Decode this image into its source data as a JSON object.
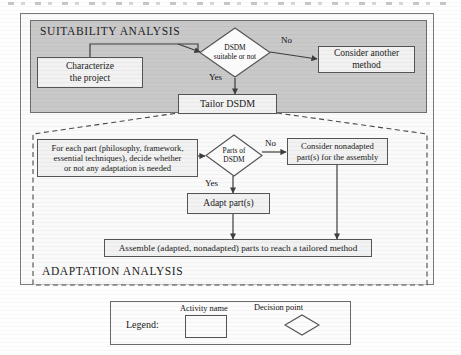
{
  "figure": {
    "regions": {
      "suitability": {
        "title": "SUITABILITY ANALYSIS"
      },
      "adaptation": {
        "title": "ADAPTATION ANALYSIS"
      }
    },
    "nodes": {
      "characterize": {
        "label": "Characterize\nthe project",
        "type": "activity"
      },
      "dsdm_decision": {
        "label": "DSDM\nsuitable or not",
        "type": "decision"
      },
      "consider_another": {
        "label": "Consider another\nmethod",
        "type": "activity"
      },
      "tailor_dsdm": {
        "label": "Tailor DSDM",
        "type": "activity"
      },
      "for_each_part": {
        "label": "For each part (philosophy, framework,\nessential techniques), decide whether\nor not any adaptation is needed",
        "type": "activity"
      },
      "parts_decision": {
        "label": "Parts of\nDSDM",
        "type": "decision"
      },
      "consider_nonadapted": {
        "label": "Consider nonadapted\npart(s) for the assembly",
        "type": "activity"
      },
      "adapt_parts": {
        "label": "Adapt part(s)",
        "type": "activity"
      },
      "assemble": {
        "label": "Assemble (adapted, nonadapted) parts to reach a tailored method",
        "type": "activity"
      }
    },
    "edge_labels": {
      "dsdm_no": "No",
      "dsdm_yes": "Yes",
      "parts_no": "No",
      "parts_yes": "Yes"
    },
    "legend": {
      "title": "Legend:",
      "activity_caption": "Activity name",
      "decision_caption": "Decision point"
    },
    "colors": {
      "suitability_fill": "#c9c9c9",
      "node_fill": "#f2f2f2",
      "stroke": "#555555",
      "page_bg": "#ffffff"
    }
  }
}
